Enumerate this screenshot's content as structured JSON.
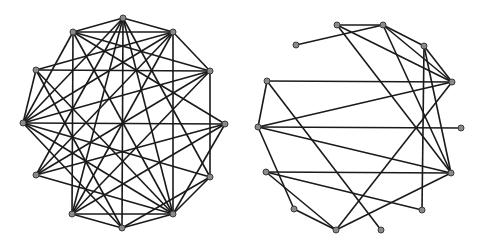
{
  "diagram": {
    "type": "network-graphs",
    "graphs": [
      {
        "name": "left-graph",
        "nodes": {
          "A": [
            123,
            18
          ],
          "B": [
            73,
            32
          ],
          "C": [
            173,
            32
          ],
          "D": [
            36,
            70
          ],
          "E": [
            210,
            71
          ],
          "F": [
            23,
            123
          ],
          "G": [
            225,
            124
          ],
          "H": [
            36,
            175
          ],
          "I": [
            210,
            177
          ],
          "J": [
            72,
            214
          ],
          "K": [
            173,
            214
          ],
          "L": [
            122,
            228
          ]
        },
        "edges": [
          [
            "A",
            "B"
          ],
          [
            "A",
            "C"
          ],
          [
            "A",
            "J"
          ],
          [
            "A",
            "L"
          ],
          [
            "A",
            "K"
          ],
          [
            "A",
            "H"
          ],
          [
            "A",
            "I"
          ],
          [
            "A",
            "F"
          ],
          [
            "B",
            "C"
          ],
          [
            "B",
            "J"
          ],
          [
            "B",
            "F"
          ],
          [
            "B",
            "G"
          ],
          [
            "B",
            "E"
          ],
          [
            "B",
            "K"
          ],
          [
            "C",
            "K"
          ],
          [
            "C",
            "E"
          ],
          [
            "C",
            "F"
          ],
          [
            "C",
            "D"
          ],
          [
            "C",
            "H"
          ],
          [
            "C",
            "J"
          ],
          [
            "D",
            "E"
          ],
          [
            "D",
            "F"
          ],
          [
            "D",
            "L"
          ],
          [
            "D",
            "K"
          ],
          [
            "E",
            "F"
          ],
          [
            "E",
            "I"
          ],
          [
            "E",
            "J"
          ],
          [
            "E",
            "H"
          ],
          [
            "F",
            "G"
          ],
          [
            "F",
            "K"
          ],
          [
            "F",
            "I"
          ],
          [
            "F",
            "L"
          ],
          [
            "G",
            "H"
          ],
          [
            "G",
            "K"
          ],
          [
            "G",
            "J"
          ],
          [
            "H",
            "K"
          ],
          [
            "I",
            "K"
          ],
          [
            "I",
            "L"
          ],
          [
            "J",
            "K"
          ],
          [
            "J",
            "L"
          ],
          [
            "K",
            "L"
          ]
        ]
      },
      {
        "name": "right-graph",
        "nodes": {
          "a": [
            337,
            25
          ],
          "b": [
            383,
            25
          ],
          "c": [
            296,
            45
          ],
          "d": [
            424,
            46
          ],
          "e": [
            267,
            81
          ],
          "f": [
            452,
            82
          ],
          "g": [
            258,
            127
          ],
          "h": [
            461,
            128
          ],
          "i": [
            266,
            172
          ],
          "j": [
            451,
            173
          ],
          "k": [
            294,
            209
          ],
          "l": [
            422,
            210
          ],
          "m": [
            336,
            230
          ],
          "n": [
            381,
            230
          ]
        },
        "edges": [
          [
            "a",
            "b"
          ],
          [
            "c",
            "b"
          ],
          [
            "a",
            "f"
          ],
          [
            "b",
            "f"
          ],
          [
            "d",
            "f"
          ],
          [
            "b",
            "d"
          ],
          [
            "a",
            "j"
          ],
          [
            "b",
            "j"
          ],
          [
            "d",
            "l"
          ],
          [
            "d",
            "j"
          ],
          [
            "e",
            "f"
          ],
          [
            "e",
            "g"
          ],
          [
            "e",
            "n"
          ],
          [
            "g",
            "f"
          ],
          [
            "g",
            "h"
          ],
          [
            "g",
            "j"
          ],
          [
            "g",
            "k"
          ],
          [
            "i",
            "j"
          ],
          [
            "i",
            "l"
          ],
          [
            "i",
            "m"
          ],
          [
            "k",
            "m"
          ],
          [
            "m",
            "j"
          ],
          [
            "m",
            "f"
          ]
        ]
      }
    ]
  }
}
